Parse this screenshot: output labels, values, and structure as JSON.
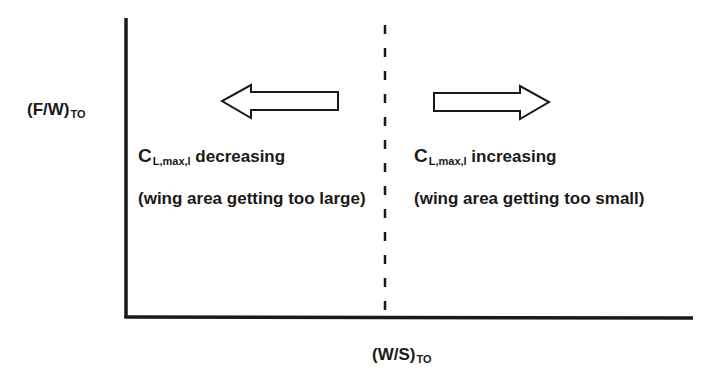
{
  "axes": {
    "y_label": {
      "main": "(F/W)",
      "sub": "TO"
    },
    "x_label": {
      "main": "(W/S)",
      "sub": "TO"
    }
  },
  "divider": {
    "style": "dashed"
  },
  "left_region": {
    "arrow_direction": "left",
    "title": {
      "main": "C",
      "sub": "L,max,l",
      "rest": " decreasing"
    },
    "note": "(wing area getting too large)"
  },
  "right_region": {
    "arrow_direction": "right",
    "title": {
      "main": "C",
      "sub": "L,max,l",
      "rest": " increasing"
    },
    "note": "(wing area getting too small)"
  },
  "colors": {
    "line": "#1a1a1a",
    "background": "#ffffff"
  }
}
